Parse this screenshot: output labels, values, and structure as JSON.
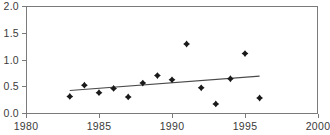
{
  "chart_data": {
    "type": "scatter",
    "title": "",
    "xlabel": "",
    "ylabel": "",
    "xlim": [
      1980,
      2000
    ],
    "ylim": [
      0.0,
      2.0
    ],
    "grid": false,
    "legend": null,
    "xticks": [
      "1980",
      "1985",
      "1990",
      "1995",
      "2000"
    ],
    "xtick_values": [
      1980,
      1985,
      1990,
      1995,
      2000
    ],
    "yticks": [
      "0.0",
      "0.5",
      "1.0",
      "1.5",
      "2.0"
    ],
    "ytick_values": [
      0.0,
      0.5,
      1.0,
      1.5,
      2.0
    ],
    "marker": "diamond",
    "marker_color": "#1a1a1a",
    "series": [
      {
        "name": "observations",
        "x": [
          1983,
          1984,
          1985,
          1986,
          1987,
          1988,
          1989,
          1990,
          1991,
          1992,
          1993,
          1994,
          1995,
          1996
        ],
        "values": [
          0.31,
          0.52,
          0.38,
          0.46,
          0.3,
          0.56,
          0.7,
          0.62,
          1.29,
          0.47,
          0.17,
          0.64,
          1.11,
          0.28
        ]
      }
    ],
    "trend_line": {
      "name": "linear-fit",
      "x": [
        1983,
        1996
      ],
      "values": [
        0.42,
        0.69
      ],
      "color": "#4a4a4a"
    }
  },
  "axes": {
    "y_axis_name": "value-axis",
    "x_axis_name": "year-axis"
  },
  "clipped_header": {
    "text": ""
  }
}
